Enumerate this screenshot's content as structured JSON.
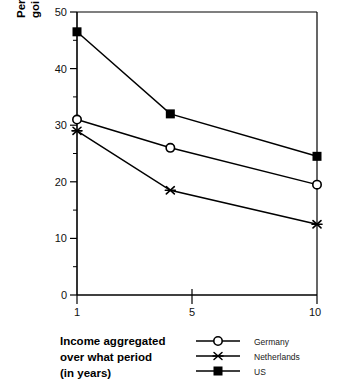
{
  "chart_data": {
    "type": "line",
    "title": "",
    "subtitle": "",
    "xlabel": "Income aggregated over what period (in years)",
    "ylabel": "Percentage of public transfer expenditures going to the poor (Beckerman index)",
    "x": [
      1,
      4.5,
      10
    ],
    "xlim": [
      1,
      10
    ],
    "ylim": [
      0,
      50
    ],
    "xticks": [
      1,
      5,
      10
    ],
    "xtick_labels": [
      "1",
      "5",
      "10"
    ],
    "yticks": [
      0,
      10,
      20,
      30,
      40,
      50
    ],
    "ytick_labels": [
      "0",
      "10",
      "20",
      "30",
      "40",
      "50"
    ],
    "yticks_minor": [
      5,
      15,
      25,
      35,
      45
    ],
    "grid": false,
    "legend_position": "bottom-right",
    "series": [
      {
        "name": "Germany",
        "marker": "open-circle",
        "values": [
          31.0,
          26.0,
          19.5
        ]
      },
      {
        "name": "Netherlands",
        "marker": "star",
        "values": [
          29.0,
          18.5,
          12.5
        ]
      },
      {
        "name": "US",
        "marker": "filled-square",
        "values": [
          46.5,
          32.0,
          24.5
        ]
      }
    ],
    "colors": {
      "line": "#000000",
      "marker_fill": "#000000",
      "marker_open_fill": "#ffffff",
      "axis": "#000000",
      "background": "#ffffff"
    }
  },
  "axis": {
    "x_title_line1": "Income aggregated",
    "x_title_line2": "over what period",
    "x_title_line3": "(in years)",
    "y_title_line1": "Percentage of public transfer expenditures",
    "y_title_line2": "going to the poor (Beckerman index)",
    "y_tick_50": "50",
    "y_tick_40": "40",
    "y_tick_30": "30",
    "y_tick_20": "20",
    "y_tick_10": "10",
    "y_tick_0": "0",
    "x_tick_1": "1",
    "x_tick_5": "5",
    "x_tick_10": "10"
  },
  "legend": {
    "items": [
      {
        "label": "Germany",
        "marker": "open-circle"
      },
      {
        "label": "Netherlands",
        "marker": "star"
      },
      {
        "label": "US",
        "marker": "filled-square"
      }
    ]
  }
}
